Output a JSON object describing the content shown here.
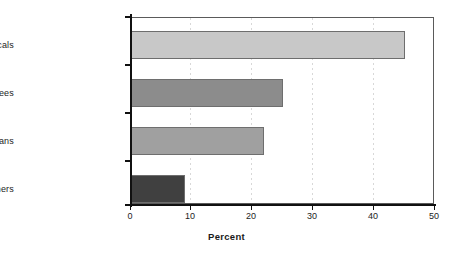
{
  "chart_data": {
    "type": "bar",
    "orientation": "horizontal",
    "title": "",
    "subtitle": "",
    "xlabel": "Percent",
    "ylabel": "",
    "categories": [
      "Locals",
      "Returnees",
      "Non-resident Ghanaians",
      "Others"
    ],
    "values": [
      45.2,
      25.0,
      22.0,
      8.9
    ],
    "series": [
      {
        "name": "Percent",
        "values": [
          45.2,
          25.0,
          22.0,
          8.9
        ]
      }
    ],
    "bar_colors": [
      "#c8c8c8",
      "#8c8c8c",
      "#a0a0a0",
      "#404040"
    ],
    "xlim": [
      0,
      50
    ],
    "xticks": [
      0,
      10,
      20,
      30,
      40,
      50
    ],
    "xtick_labels": [
      "0",
      "10",
      "20",
      "30",
      "40",
      "50"
    ],
    "grid": {
      "vertical": true,
      "horizontal": false,
      "style": "dotted",
      "color": "#d8d8d8"
    },
    "legend": {
      "visible": false,
      "position": "none",
      "entries": []
    },
    "axes": {
      "frame": true,
      "frame_color": "#5a5a5a",
      "axis_color": "#111111",
      "bar_edge_color": "#6e6e6e"
    },
    "background_color": "#ffffff",
    "text_color": "#1d1d1d"
  }
}
